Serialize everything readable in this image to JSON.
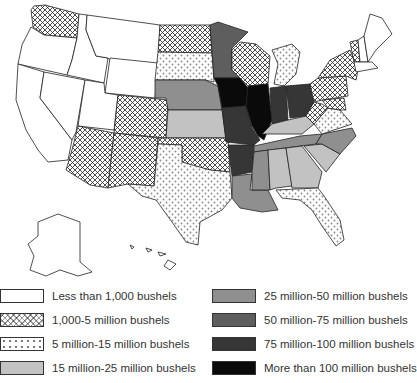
{
  "map": {
    "subject": "Corn production by state (bushels)",
    "states": [
      {
        "name": "Washington",
        "category": 1
      },
      {
        "name": "Oregon",
        "category": 0
      },
      {
        "name": "California",
        "category": 0
      },
      {
        "name": "Idaho",
        "category": 0
      },
      {
        "name": "Nevada",
        "category": 0
      },
      {
        "name": "Montana",
        "category": 0
      },
      {
        "name": "Wyoming",
        "category": 0
      },
      {
        "name": "Utah",
        "category": 0
      },
      {
        "name": "Colorado",
        "category": 1
      },
      {
        "name": "Arizona",
        "category": 1
      },
      {
        "name": "New Mexico",
        "category": 1
      },
      {
        "name": "North Dakota",
        "category": 1
      },
      {
        "name": "South Dakota",
        "category": 2
      },
      {
        "name": "Nebraska",
        "category": 4
      },
      {
        "name": "Kansas",
        "category": 3
      },
      {
        "name": "Oklahoma",
        "category": 1
      },
      {
        "name": "Texas",
        "category": 2
      },
      {
        "name": "Minnesota",
        "category": 5
      },
      {
        "name": "Iowa",
        "category": 7
      },
      {
        "name": "Missouri",
        "category": 6
      },
      {
        "name": "Arkansas",
        "category": 6
      },
      {
        "name": "Louisiana",
        "category": 4
      },
      {
        "name": "Wisconsin",
        "category": 1
      },
      {
        "name": "Illinois",
        "category": 7
      },
      {
        "name": "Michigan",
        "category": 2
      },
      {
        "name": "Indiana",
        "category": 6
      },
      {
        "name": "Ohio",
        "category": 6
      },
      {
        "name": "Kentucky",
        "category": 3
      },
      {
        "name": "Tennessee",
        "category": 4
      },
      {
        "name": "Mississippi",
        "category": 4
      },
      {
        "name": "Alabama",
        "category": 3
      },
      {
        "name": "Georgia",
        "category": 3
      },
      {
        "name": "Florida",
        "category": 2
      },
      {
        "name": "South Carolina",
        "category": 3
      },
      {
        "name": "North Carolina",
        "category": 4
      },
      {
        "name": "Virginia",
        "category": 2
      },
      {
        "name": "West Virginia",
        "category": 1
      },
      {
        "name": "Pennsylvania",
        "category": 1
      },
      {
        "name": "New York",
        "category": 1
      },
      {
        "name": "Vermont",
        "category": 1
      },
      {
        "name": "New Hampshire",
        "category": 0
      },
      {
        "name": "Maine",
        "category": 0
      },
      {
        "name": "Massachusetts",
        "category": 0
      },
      {
        "name": "Maryland",
        "category": 1
      },
      {
        "name": "Alaska",
        "category": 0
      },
      {
        "name": "Hawaii",
        "category": 0
      }
    ]
  },
  "legend": {
    "items": [
      {
        "label": "Less than 1,000 bushels",
        "fill": "#ffffff",
        "pattern": "none"
      },
      {
        "label": "1,000-5 million bushels",
        "fill": "#ffffff",
        "pattern": "crosshatch"
      },
      {
        "label": "5 million-15 million bushels",
        "fill": "#ffffff",
        "pattern": "dots"
      },
      {
        "label": "15 million-25 million bushels",
        "fill": "#c2c2c2",
        "pattern": "none"
      },
      {
        "label": "25 million-50 million bushels",
        "fill": "#8f8f8f",
        "pattern": "none"
      },
      {
        "label": "50 million-75 million bushels",
        "fill": "#5e5e5e",
        "pattern": "none"
      },
      {
        "label": "75 million-100 million bushels",
        "fill": "#363636",
        "pattern": "none"
      },
      {
        "label": "More than 100 million bushels",
        "fill": "#0a0a0a",
        "pattern": "none"
      }
    ]
  }
}
